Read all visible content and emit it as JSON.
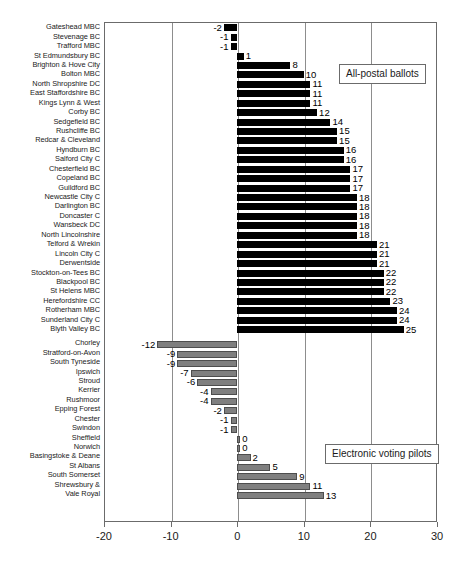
{
  "chart_data": {
    "type": "bar",
    "orientation": "horizontal",
    "title": "",
    "xlabel": "",
    "ylabel": "",
    "xlim": [
      -20,
      30
    ],
    "xticks": [
      -20,
      -10,
      0,
      10,
      20,
      30
    ],
    "xtick_labels": [
      "-20",
      "-10",
      "0",
      "10",
      "20",
      "30"
    ],
    "grid": true,
    "grid_axis": "x",
    "legend_position": "inside-right",
    "series": [
      {
        "name": "All-postal ballots",
        "color": "#000000",
        "categories": [
          "Gateshead MBC",
          "Stevenage BC",
          "Trafford MBC",
          "St Edmundsbury BC",
          "Brighton & Hove City",
          "Bolton MBC",
          "North Shropshire DC",
          "East Staffordshire BC",
          "Kings Lynn & West",
          "Corby BC",
          "Sedgefield BC",
          "Rushcliffe BC",
          "Redcar & Cleveland",
          "Hyndburn BC",
          "Salford City C",
          "Chesterfield BC",
          "Copeland BC",
          "Guildford BC",
          "Newcastle City C",
          "Darlington BC",
          "Doncaster C",
          "Wansbeck DC",
          "North Lincolnshire",
          "Telford & Wrekin",
          "Lincoln City C",
          "Derwentside",
          "Stockton-on-Tees BC",
          "Blackpool BC",
          "St Helens MBC",
          "Herefordshire CC",
          "Rotherham MBC",
          "Sunderland City C",
          "Blyth Valley BC"
        ],
        "values": [
          -2,
          -1,
          -1,
          1,
          8,
          10,
          11,
          11,
          11,
          12,
          14,
          15,
          15,
          16,
          16,
          17,
          17,
          17,
          18,
          18,
          18,
          18,
          18,
          21,
          21,
          21,
          22,
          22,
          22,
          23,
          24,
          24,
          25
        ]
      },
      {
        "name": "Electronic voting pilots",
        "color": "#7f7f7f",
        "categories": [
          "Chorley",
          "Stratford-on-Avon",
          "South Tyneside",
          "Ipswich",
          "Stroud",
          "Kerrier",
          "Rushmoor",
          "Epping Forest",
          "Chester",
          "Swindon",
          "Sheffield",
          "Norwich",
          "Basingstoke & Deane",
          "St Albans",
          "South Somerset",
          "Shrewsbury &",
          "Vale Royal"
        ],
        "values": [
          -12,
          -9,
          -9,
          -7,
          -6,
          -4,
          -4,
          -2,
          -1,
          -1,
          0,
          0,
          2,
          5,
          9,
          11,
          13
        ]
      }
    ]
  },
  "legend": {
    "postal": "All-postal ballots",
    "epilot": "Electronic voting pilots"
  }
}
